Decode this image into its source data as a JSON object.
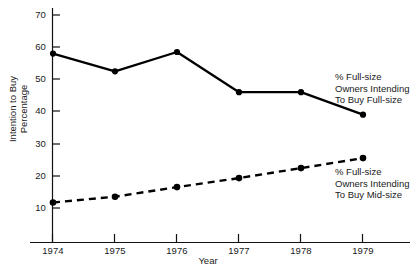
{
  "chart_data": {
    "type": "line",
    "title": "",
    "xlabel": "Year",
    "ylabel": "Intention to Buy Percentage",
    "ylabel_lines": [
      "Intention to Buy",
      "Percentage"
    ],
    "categories": [
      "1974",
      "1975",
      "1976",
      "1977",
      "1978",
      "1979"
    ],
    "x": [
      1974,
      1975,
      1976,
      1977,
      1978,
      1979
    ],
    "ylim": [
      0,
      70
    ],
    "yticks": [
      70,
      60,
      50,
      40,
      30,
      20,
      10
    ],
    "ytick_labels": [
      "70",
      "60",
      "50",
      "40",
      "30",
      "20",
      "10"
    ],
    "xtick_labels": [
      "1974",
      "1975",
      "1976",
      "1977",
      "1978",
      "1979"
    ],
    "grid": false,
    "legend_position": "inline-annotations",
    "series": [
      {
        "name": "% Full-size Owners Intending To Buy Full-size",
        "style": "solid",
        "marker": "filled-circle",
        "color": "#000000",
        "values": [
          58,
          52.5,
          58.5,
          46,
          46,
          39
        ],
        "annotation_lines": [
          "% Full-size",
          "Owners Intending",
          "To Buy Full-size"
        ]
      },
      {
        "name": "% Full-size Owners Intending To Buy Mid-size",
        "style": "dashed",
        "marker": "filled-circle",
        "color": "#000000",
        "values": [
          11.7,
          13.5,
          16.5,
          19.3,
          22.4,
          25.5
        ],
        "annotation_lines": [
          "% Full-size",
          "Owners Intending",
          "To Buy Mid-size"
        ]
      }
    ]
  },
  "axes": {
    "y_title_line1": "Intention to Buy",
    "y_title_line2": "Percentage",
    "x_title": "Year",
    "y_labels": {
      "t70": "70",
      "t60": "60",
      "t50": "50",
      "t40": "40",
      "t30": "30",
      "t20": "20",
      "t10": "10"
    },
    "x_labels": {
      "x1974": "1974",
      "x1975": "1975",
      "x1976": "1976",
      "x1977": "1977",
      "x1978": "1978",
      "x1979": "1979"
    }
  },
  "annotations": {
    "fullsize": {
      "line1": "% Full-size",
      "line2": "Owners Intending",
      "line3": "To Buy Full-size"
    },
    "midsize": {
      "line1": "% Full-size",
      "line2": "Owners Intending",
      "line3": "To Buy Mid-size"
    }
  },
  "colors": {
    "ink": "#000000",
    "background": "#ffffff"
  }
}
